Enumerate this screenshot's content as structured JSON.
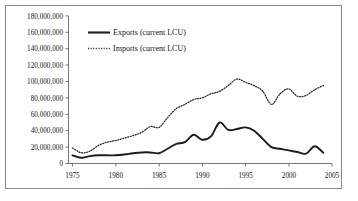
{
  "chart_data": {
    "type": "line",
    "title": "",
    "xlabel": "",
    "ylabel": "",
    "xlim": [
      1975,
      2005
    ],
    "ylim": [
      0,
      180000000
    ],
    "grid": false,
    "legend_position": "top-left-inside",
    "x_ticks": [
      "1975",
      "1980",
      "1985",
      "1990",
      "1995",
      "2000",
      "2005"
    ],
    "x_tick_values": [
      1975,
      1980,
      1985,
      1990,
      1995,
      2000,
      2005
    ],
    "y_ticks": [
      "0",
      "20,000,000",
      "40,000,000",
      "60,000,000",
      "80,000,000",
      "100,000,000",
      "120,000,000",
      "140,000,000",
      "160,000,000",
      "180,000,000"
    ],
    "y_tick_values": [
      0,
      20000000,
      40000000,
      60000000,
      80000000,
      100000000,
      120000000,
      140000000,
      160000000,
      180000000
    ],
    "x": [
      1975,
      1976,
      1977,
      1978,
      1979,
      1980,
      1981,
      1982,
      1983,
      1984,
      1985,
      1986,
      1987,
      1988,
      1989,
      1990,
      1991,
      1992,
      1993,
      1994,
      1995,
      1996,
      1997,
      1998,
      1999,
      2000,
      2001,
      2002,
      2003,
      2004
    ],
    "series": [
      {
        "name": "Exports (current LCU)",
        "style": "solid",
        "color": "#1c1c1c",
        "values": [
          10000000,
          7000000,
          9000000,
          10000000,
          10000000,
          10000000,
          11000000,
          12500000,
          13500000,
          13500000,
          12500000,
          18000000,
          24000000,
          26000000,
          35000000,
          29000000,
          33000000,
          50000000,
          41000000,
          42000000,
          44000000,
          40000000,
          30000000,
          20000000,
          18000000,
          16000000,
          14000000,
          12000000,
          21000000,
          13000000
        ]
      },
      {
        "name": "Imports (current LCU)",
        "style": "dotted",
        "color": "#2a2a2a",
        "values": [
          19000000,
          13000000,
          15000000,
          22000000,
          26000000,
          28000000,
          31000000,
          34000000,
          38000000,
          45000000,
          44000000,
          56000000,
          67000000,
          72000000,
          78000000,
          80000000,
          85000000,
          88000000,
          95000000,
          103000000,
          99000000,
          95000000,
          88000000,
          72000000,
          85000000,
          91000000,
          82000000,
          83000000,
          90000000,
          95000000
        ]
      }
    ],
    "legend": [
      {
        "label": "Exports (current LCU)",
        "style": "solid"
      },
      {
        "label": "Imports (current LCU)",
        "style": "dotted"
      }
    ]
  },
  "legend_entries": {
    "exports": "Exports (current LCU)",
    "imports": "Imports (current LCU)"
  },
  "axis": {
    "y_0": "0",
    "y_20m": "20,000,000",
    "y_40m": "40,000,000",
    "y_60m": "60,000,000",
    "y_80m": "80,000,000",
    "y_100m": "100,000,000",
    "y_120m": "120,000,000",
    "y_140m": "140,000,000",
    "y_160m": "160,000,000",
    "y_180m": "180,000,000",
    "x_1975": "1975",
    "x_1980": "1980",
    "x_1985": "1985",
    "x_1990": "1990",
    "x_1995": "1995",
    "x_2000": "2000",
    "x_2005": "2005"
  }
}
